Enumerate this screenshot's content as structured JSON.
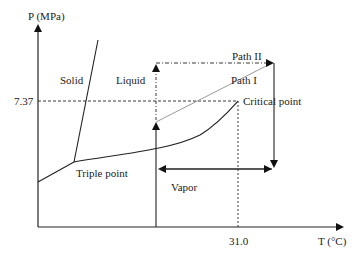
{
  "diagram": {
    "type": "phase_diagram",
    "axes": {
      "y_label": "P (MPa)",
      "x_label": "T (°C)",
      "y_tick": "7.37",
      "x_tick": "31.0"
    },
    "regions": {
      "solid": "Solid",
      "liquid": "Liquid",
      "vapor": "Vapor"
    },
    "points": {
      "triple": "Triple point",
      "critical": "Critical point"
    },
    "paths": {
      "path1": "Path I",
      "path2": "Path II"
    },
    "colors": {
      "line": "#222222",
      "path1_line": "#9a9a9a",
      "background": "#ffffff"
    }
  }
}
